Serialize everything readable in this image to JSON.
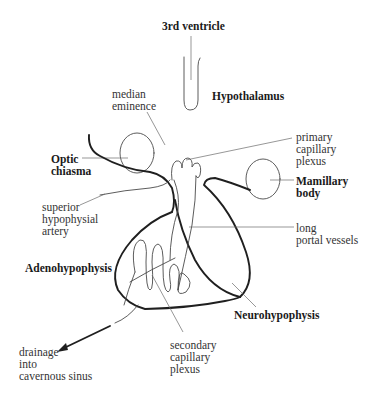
{
  "diagram": {
    "type": "anatomical-diagram",
    "labels": {
      "third_ventricle": "3rd ventricle",
      "hypothalamus": "Hypothalamus",
      "median_eminence": "median\neminence",
      "optic_chiasma": "Optic\nchiasma",
      "primary_capillary_plexus": "primary\ncapillary\nplexus",
      "mamillary_body": "Mamillary\nbody",
      "superior_hypophysial_artery": "superior\nhypophysial\nartery",
      "long_portal_vessels": "long\nportal vessels",
      "adenohypophysis": "Adenohypophysis",
      "neurohypophysis": "Neurohypophysis",
      "drainage": "drainage\ninto\ncavernous sinus",
      "secondary_capillary_plexus": "secondary\ncapillary\nplexus"
    },
    "colors": {
      "background": "#ffffff",
      "outline": "#1f1f1f",
      "vessel": "#4a4a4a",
      "leader": "#6a6a6a",
      "text": "#333333"
    }
  }
}
